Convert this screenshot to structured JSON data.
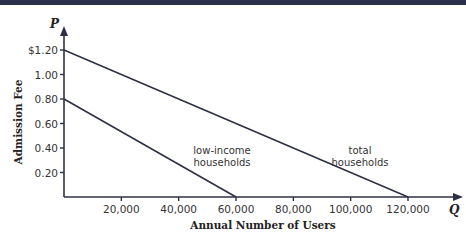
{
  "chart_data": {
    "type": "line",
    "title": "",
    "xlabel": "Annual Number of Users",
    "ylabel": "Admission Fee",
    "x_axis_letter": "Q",
    "y_axis_letter": "P",
    "xlim": [
      0,
      125000
    ],
    "ylim": [
      0,
      1.3
    ],
    "x_ticks": [
      20000,
      40000,
      60000,
      80000,
      100000,
      120000
    ],
    "x_tick_labels": [
      "20,000",
      "40,000",
      "60,000",
      "80,000",
      "100,000",
      "120,000"
    ],
    "y_ticks": [
      0.2,
      0.4,
      0.6,
      0.8,
      1.0,
      1.2
    ],
    "y_tick_labels": [
      "0.20",
      "0.40",
      "0.60",
      "0.80",
      "1.00",
      "$1.20"
    ],
    "grid": false,
    "series": [
      {
        "name": "low-income households",
        "label_lines": [
          "low-income",
          "households"
        ],
        "points": [
          [
            0,
            0.8
          ],
          [
            60000,
            0
          ]
        ]
      },
      {
        "name": "total households",
        "label_lines": [
          "total",
          "households"
        ],
        "points": [
          [
            0,
            1.2
          ],
          [
            120000,
            0
          ]
        ]
      }
    ],
    "colors": {
      "line": "#2e3045",
      "axis": "#2e3045",
      "text": "#333333"
    }
  }
}
